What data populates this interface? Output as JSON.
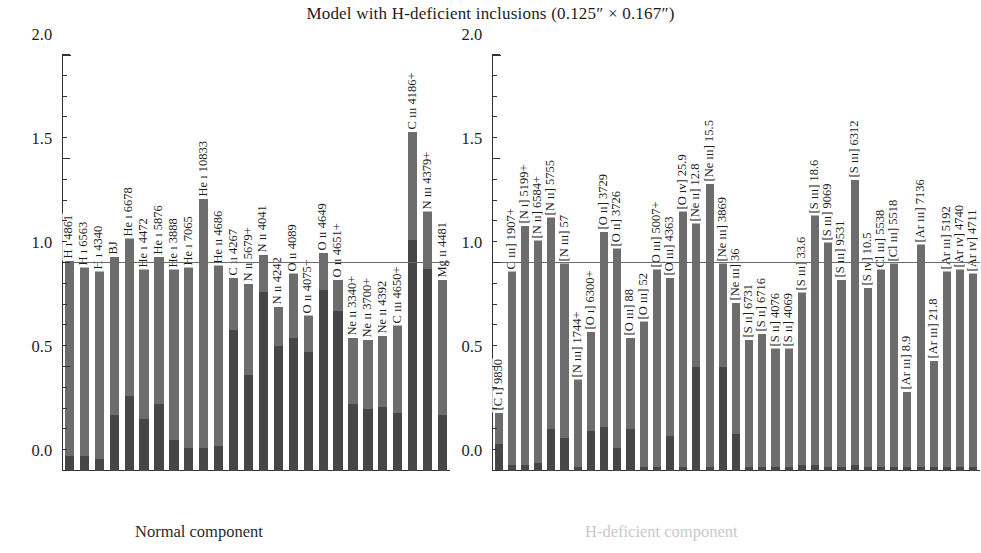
{
  "title": "Model with H-deficient inclusions (0.125″ × 0.167″)",
  "axis": {
    "ylabel": "Mod/Obs",
    "yticks": [
      "0.0",
      "0.5",
      "1.0",
      "1.5",
      "2.0"
    ],
    "ymin": 0.0,
    "ymax": 2.0
  },
  "captions": {
    "left": "Normal component",
    "right": "H-deficient component"
  },
  "colors": {
    "bar": "#6d6d6d",
    "bar_dark": "#464646",
    "unity_line": "#6a6a6a",
    "axis": "#333333",
    "caption_right": "#c9c9c9"
  },
  "chart_data": [
    {
      "type": "bar",
      "panel": "left",
      "title": "Normal component",
      "xlabel": "",
      "ylabel": "Mod/Obs",
      "ylim": [
        0.0,
        2.0
      ],
      "grid": false,
      "reference_line": 1.0,
      "legend": "none",
      "note": "Each bar is a total Mod/Obs ratio; the darker lower segment marks the sub-component contribution.",
      "categories": [
        "H ı 4861",
        "H ı 6563",
        "H ı 4340",
        "BJ",
        "He ı 6678",
        "He ı 4472",
        "He ı 5876",
        "He ı 3888",
        "He ı 7065",
        "He ı 10833",
        "He ıı 4686",
        "C ıı 4267",
        "N ıı 5679+",
        "N ıı 4041",
        "N ıı 4242",
        "O ıı 4089",
        "O ıı 4075+",
        "O ıı 4649",
        "O ıı 4651+",
        "Ne ıı 3340+",
        "Ne ıı 3700+",
        "Ne ıı 4392",
        "C ııı 4650+",
        "C ııı 4186+",
        "N ııı 4379+",
        "Mg ıı 4481"
      ],
      "values": [
        1.01,
        0.98,
        0.96,
        1.03,
        1.12,
        0.97,
        1.03,
        0.97,
        0.98,
        1.31,
        0.99,
        0.93,
        0.9,
        1.04,
        0.79,
        0.95,
        0.75,
        1.05,
        0.92,
        0.64,
        0.63,
        0.65,
        0.7,
        1.63,
        1.25,
        0.92
      ],
      "subcomponent_values": [
        0.07,
        0.07,
        0.06,
        0.27,
        0.36,
        0.25,
        0.32,
        0.15,
        0.11,
        0.11,
        0.12,
        0.68,
        0.46,
        0.86,
        0.6,
        0.64,
        0.57,
        0.87,
        0.77,
        0.32,
        0.3,
        0.31,
        0.28,
        1.11,
        0.97,
        0.27
      ]
    },
    {
      "type": "bar",
      "panel": "right",
      "title": "H-deficient component",
      "xlabel": "",
      "ylabel": "Mod/Obs",
      "ylim": [
        0.0,
        2.0
      ],
      "grid": false,
      "reference_line": 1.0,
      "legend": "none",
      "note": "Each bar is a total Mod/Obs ratio; the darker lower segment marks the sub-component contribution.",
      "categories": [
        "[C ı] 9850",
        "C ııı] 1907+",
        "[N ı] 5199+",
        "[N ıı] 6584+",
        "[N ıı] 5755",
        "[N ııı] 57",
        "[N ııı] 1744+",
        "[O ı] 6300+",
        "[O ıı] 3729",
        "[O ıı] 3726",
        "[O ııı] 88",
        "[O ııı] 52",
        "[O ııı] 5007+",
        "[O ııı] 4363",
        "[O ıv] 25.9",
        "[Ne ıı] 12.8",
        "[Ne ııı] 15.5",
        "[Ne ııı] 3869",
        "[Ne ııı] 36",
        "[S ıı] 6731",
        "[S ıı] 6716",
        "[S ıı] 4076",
        "[S ıı] 4069",
        "[S ııı] 33.6",
        "[S ııı] 18.6",
        "[S ııı] 9069",
        "[S ııı] 9531",
        "[S ııı] 6312",
        "[S ıv] 10.5",
        "Cl ııı] 5538",
        "[Cl ııı] 5518",
        "[Ar ııı] 8.9",
        "[Ar ııı] 7136",
        "[Ar ııı] 21.8",
        "[Ar ııı] 5192",
        "[Ar ıv] 4740",
        "[Ar ıv] 4711"
      ],
      "values": [
        0.28,
        0.96,
        1.18,
        1.11,
        1.22,
        1.0,
        0.44,
        0.67,
        1.15,
        1.07,
        0.64,
        0.72,
        0.97,
        0.93,
        1.25,
        1.19,
        1.38,
        1.0,
        0.81,
        0.63,
        0.66,
        0.59,
        0.59,
        0.86,
        1.23,
        1.1,
        0.92,
        1.4,
        0.88,
        0.97,
        1.0,
        0.38,
        1.09,
        0.53,
        0.96,
        0.97,
        0.95
      ],
      "subcomponent_values": [
        0.13,
        0.03,
        0.03,
        0.04,
        0.2,
        0.16,
        0.02,
        0.19,
        0.21,
        0.11,
        0.2,
        0.02,
        0.02,
        0.17,
        0.02,
        0.5,
        0.02,
        0.5,
        0.18,
        0.02,
        0.02,
        0.02,
        0.02,
        0.03,
        0.03,
        0.02,
        0.02,
        0.03,
        0.02,
        0.02,
        0.02,
        0.02,
        0.02,
        0.02,
        0.02,
        0.02,
        0.02
      ]
    }
  ]
}
